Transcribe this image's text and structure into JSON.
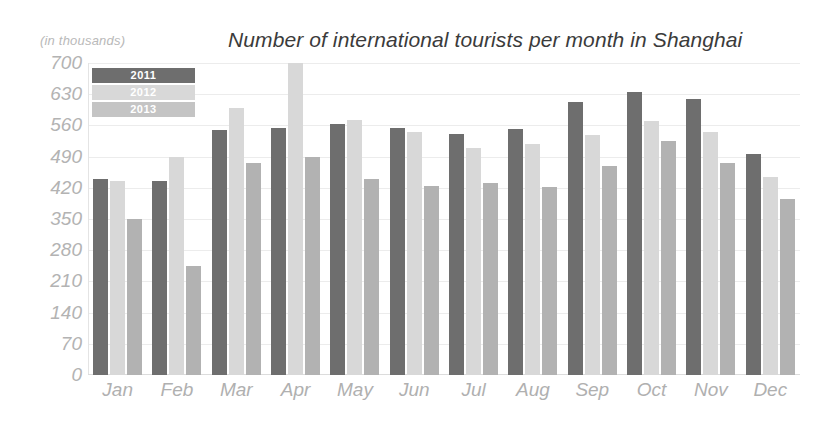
{
  "chart_data": {
    "type": "bar",
    "title": "Number of international tourists per month in Shanghai",
    "units_note": "(in thousands)",
    "xlabel": "",
    "ylabel": "",
    "ylim": [
      0,
      700
    ],
    "yticks": [
      700,
      630,
      560,
      490,
      420,
      350,
      280,
      210,
      140,
      70,
      0
    ],
    "grid": true,
    "legend_position": "top-left",
    "categories": [
      "Jan",
      "Feb",
      "Mar",
      "Apr",
      "May",
      "Jun",
      "Jul",
      "Aug",
      "Sep",
      "Oct",
      "Nov",
      "Dec"
    ],
    "series": [
      {
        "name": "2011",
        "color": "#6e6e6e",
        "values": [
          440,
          435,
          550,
          555,
          563,
          555,
          540,
          553,
          612,
          635,
          620,
          495
        ]
      },
      {
        "name": "2012",
        "color": "#d8d8d8",
        "values": [
          435,
          490,
          600,
          700,
          573,
          545,
          510,
          518,
          538,
          570,
          545,
          445
        ]
      },
      {
        "name": "2013",
        "color": "#b2b2b2",
        "values": [
          350,
          245,
          475,
          490,
          440,
          425,
          430,
          422,
          470,
          525,
          475,
          395
        ]
      }
    ]
  },
  "legend": {
    "items": [
      {
        "label": "2011",
        "color": "#6e6e6e"
      },
      {
        "label": "2012",
        "color": "#d8d8d8"
      },
      {
        "label": "2013",
        "color": "#c4c4c4"
      }
    ]
  }
}
